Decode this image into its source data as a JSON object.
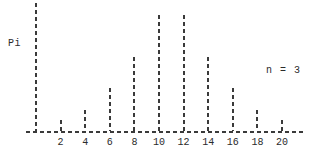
{
  "chart_data": {
    "type": "bar",
    "title": "",
    "subtitle": "",
    "ylabel": "Pi",
    "xlabel": "",
    "annotation": "n = 3",
    "grid": false,
    "legend": "none",
    "categories": [
      "0",
      "2",
      "4",
      "6",
      "8",
      "10",
      "12",
      "14",
      "16",
      "18",
      "20"
    ],
    "x": [
      0,
      2,
      4,
      6,
      8,
      10,
      12,
      14,
      16,
      18,
      20
    ],
    "values": [
      1.0,
      0.085,
      0.165,
      0.335,
      0.575,
      0.905,
      0.905,
      0.575,
      0.335,
      0.165,
      0.085
    ],
    "xlim": [
      -1,
      22
    ],
    "ylim": [
      0,
      1.0
    ],
    "tick_labels": [
      "2",
      "4",
      "6",
      "8",
      "10",
      "12",
      "14",
      "16",
      "18",
      "20"
    ],
    "tick_values": [
      2,
      4,
      6,
      8,
      10,
      12,
      14,
      16,
      18,
      20
    ],
    "line_style": "dashed-spike",
    "color": "#3a3a3a"
  },
  "labels": {
    "y_axis": "Pi",
    "annotation": "n = 3"
  },
  "ticks": [
    {
      "label": "2"
    },
    {
      "label": "4"
    },
    {
      "label": "6"
    },
    {
      "label": "8"
    },
    {
      "label": "10"
    },
    {
      "label": "12"
    },
    {
      "label": "14"
    },
    {
      "label": "16"
    },
    {
      "label": "18"
    },
    {
      "label": "20"
    }
  ]
}
